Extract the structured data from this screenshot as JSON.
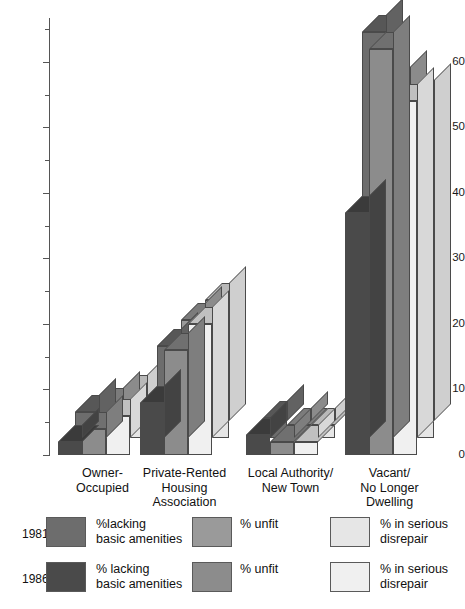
{
  "chart_data": {
    "type": "bar",
    "title": "",
    "xlabel": "",
    "ylabel": "",
    "ylim": [
      0,
      65
    ],
    "grid": false,
    "legend_position": "bottom",
    "style": "3d-grouped-bar",
    "categories": [
      "Owner-\nOccupied",
      "Private-Rented\nHousing\nAssociation",
      "Local Authority/\nNew Town",
      "Vacant/\nNo Longer\nDwelling"
    ],
    "series": [
      {
        "name": "1981 %lacking basic amenities",
        "year": "1981",
        "measure": "%lacking basic amenities",
        "values": [
          4,
          14,
          3,
          62
        ]
      },
      {
        "name": "1981 % unfit",
        "year": "1981",
        "measure": "% unfit",
        "values": [
          5,
          18,
          2,
          54
        ]
      },
      {
        "name": "1981 % in serious disrepair",
        "year": "1981",
        "measure": "% in serious disrepair",
        "values": [
          7,
          21,
          2,
          52
        ]
      },
      {
        "name": "1986 % lacking basic amenities",
        "year": "1986",
        "measure": "% lacking basic amenities",
        "values": [
          2,
          8,
          3,
          37
        ]
      },
      {
        "name": "1986 % unfit",
        "year": "1986",
        "measure": "% unfit",
        "values": [
          4,
          16,
          2,
          62
        ]
      },
      {
        "name": "1986 % in serious disrepair",
        "year": "1986",
        "measure": "% in serious disrepair",
        "values": [
          6,
          20,
          2,
          54
        ]
      }
    ],
    "yticks_major": [
      0,
      10,
      20,
      30,
      40,
      50,
      60
    ],
    "yticks_minor": [
      5,
      15,
      25,
      35,
      45,
      55
    ],
    "ytick_labels": [
      "0",
      "10",
      "20",
      "30",
      "40",
      "50",
      "60"
    ],
    "colors": {
      "lacking_1981": "#6d6d6d",
      "unfit_1981": "#9a9a9a",
      "disrepair_1981": "#e6e6e6",
      "lacking_1986": "#4a4a4a",
      "unfit_1986": "#8c8c8c",
      "disrepair_1986": "#f0f0f0",
      "outline": "#4a4a4a",
      "axis": "#555555",
      "background": "#ffffff"
    }
  },
  "axis": {
    "labels": [
      "60",
      "50",
      "40",
      "30",
      "20",
      "10",
      "0"
    ]
  },
  "categories": [
    {
      "line1": "Owner-",
      "line2": "Occupied",
      "line3": ""
    },
    {
      "line1": "Private-Rented",
      "line2": "Housing",
      "line3": "Association"
    },
    {
      "line1": "Local Authority/",
      "line2": "New Town",
      "line3": ""
    },
    {
      "line1": "Vacant/",
      "line2": "No Longer",
      "line3": "Dwelling"
    }
  ],
  "legend": {
    "rows": [
      {
        "year": "1981",
        "items": [
          {
            "label_line1": "%lacking",
            "label_line2": "basic amenities"
          },
          {
            "label_line1": "% unfit",
            "label_line2": ""
          },
          {
            "label_line1": "% in serious",
            "label_line2": "disrepair"
          }
        ]
      },
      {
        "year": "1986",
        "items": [
          {
            "label_line1": "% lacking",
            "label_line2": "basic amenities"
          },
          {
            "label_line1": "% unfit",
            "label_line2": ""
          },
          {
            "label_line1": "% in serious",
            "label_line2": "disrepair"
          }
        ]
      }
    ]
  }
}
